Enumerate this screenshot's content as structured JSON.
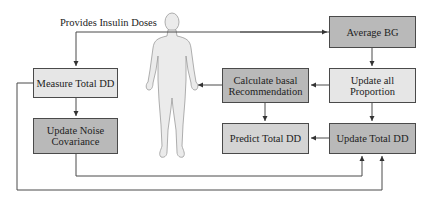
{
  "diagram": {
    "top_label": "Provides Insulin Doses",
    "boxes": {
      "measure_total_dd": "Measure Total DD",
      "update_noise_l1": "Update Noise",
      "update_noise_l2": "Covariance",
      "calc_basal_l1": "Calculate basal",
      "calc_basal_l2": "Recommendation",
      "average_bg": "Average BG",
      "update_prop_l1": "Update all",
      "update_prop_l2": "Proportion",
      "predict_total_dd": "Predict Total DD",
      "update_total_dd": "Update Total DD"
    },
    "colors": {
      "light_box": "#e6e6e6",
      "mid_box": "#d4d4d4",
      "dark_box": "#b9b9b9",
      "line": "#4a4a4a",
      "body_fill": "#ebebeb"
    }
  }
}
